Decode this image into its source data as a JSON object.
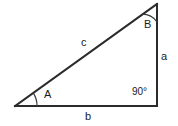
{
  "figure": {
    "background_color": "#ffffff",
    "line_color": "#2b2b2b",
    "text_color": "#1a1a1a",
    "width": 178,
    "height": 126
  },
  "labels": {
    "side_a": "a",
    "side_b": "b",
    "side_c": "c",
    "angle_A": "A",
    "angle_B": "B",
    "angle_C": "90°"
  },
  "geometry": {
    "vertex_A": {
      "x": 15,
      "y": 106
    },
    "vertex_B": {
      "x": 157,
      "y": 4
    },
    "vertex_C": {
      "x": 157,
      "y": 106
    },
    "sides": [
      {
        "name": "a",
        "from": "B",
        "to": "C",
        "description": "vertical right side"
      },
      {
        "name": "b",
        "from": "A",
        "to": "C",
        "description": "horizontal base"
      },
      {
        "name": "c",
        "from": "A",
        "to": "B",
        "description": "hypotenuse"
      }
    ],
    "angle_marks": [
      {
        "at": "A",
        "type": "arc",
        "radius": 22
      },
      {
        "at": "B",
        "type": "arc",
        "radius": 18
      },
      {
        "at": "C",
        "type": "text",
        "value": "90°"
      }
    ]
  }
}
